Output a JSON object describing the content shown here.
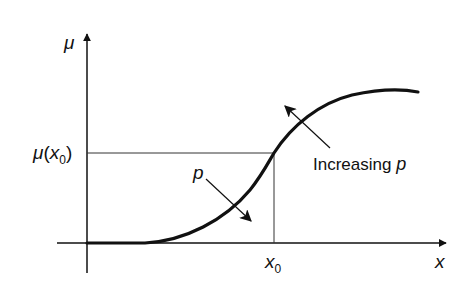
{
  "diagram": {
    "type": "sigmoid membership curve",
    "y_axis_label": "μ",
    "x_axis_label": "x",
    "y_marker_label": {
      "func": "μ",
      "open": "(",
      "var": "x",
      "sub": "0",
      "close": ")"
    },
    "x_marker_label": {
      "var": "x",
      "sub": "0"
    },
    "annotation_increasing": {
      "text": "Increasing ",
      "var": "p"
    },
    "annotation_p": "p",
    "colors": {
      "line": "#111111",
      "guide": "#333333",
      "background": "#ffffff"
    }
  }
}
